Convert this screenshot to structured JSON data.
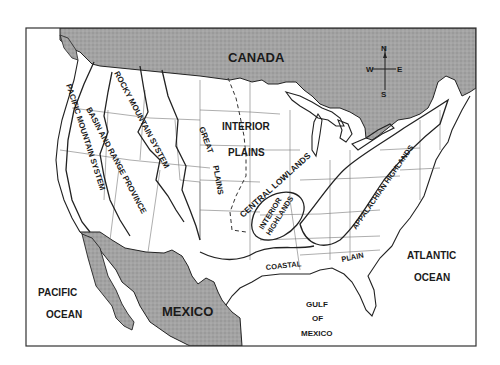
{
  "map": {
    "title": "Physiographic Regions of the United States",
    "colors": {
      "foreign_land": "#9c9c9c",
      "us_land": "#ffffff",
      "water": "#ffffff",
      "lines": "#222222"
    },
    "countries": {
      "canada": "CANADA",
      "mexico": "MEXICO"
    },
    "water_bodies": {
      "pacific_line1": "PACIFIC",
      "pacific_line2": "OCEAN",
      "atlantic_line1": "ATLANTIC",
      "atlantic_line2": "OCEAN",
      "gulf_line1": "GULF",
      "gulf_line2": "OF",
      "gulf_line3": "MEXICO"
    },
    "regions": {
      "pacific_mountain": "PACIFIC MOUNTAIN SYSTEM",
      "basin_range": "BASIN AND RANGE PROVINCE",
      "rocky_mountain": "ROCKY MOUNTAIN SYSTEM",
      "great_plains_1": "GREAT",
      "great_plains_2": "PLAINS",
      "interior_plains_1": "INTERIOR",
      "interior_plains_2": "PLAINS",
      "central_lowlands": "CENTRAL LOWLANDS",
      "interior_highlands_1": "INTERIOR",
      "interior_highlands_2": "HIGHLANDS",
      "appalachian": "APPALACHIAN HIGHLANDS",
      "coastal": "COASTAL",
      "plain": "PLAIN"
    },
    "compass": {
      "n": "N",
      "s": "S",
      "e": "E",
      "w": "W"
    }
  }
}
